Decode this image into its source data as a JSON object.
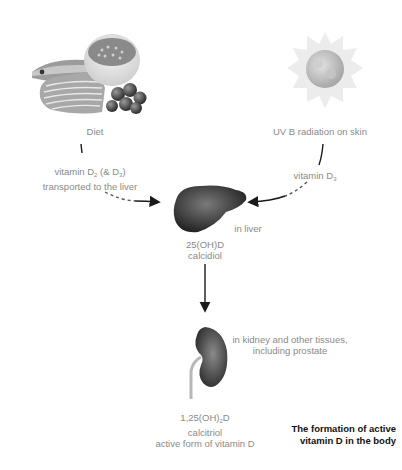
{
  "diagram": {
    "title_line1": "The formation of active",
    "title_line2": "vitamin D in the body",
    "sources": {
      "diet": {
        "label": "Diet",
        "icon": "food-illustration-icon",
        "arrow_label_line1_pre": "vitamin D",
        "arrow_label_line1_sub1": "2",
        "arrow_label_line1_mid": " (& D",
        "arrow_label_line1_sub2": "3",
        "arrow_label_line1_post": ")",
        "arrow_label_line2": "transported to the liver"
      },
      "sun": {
        "label": "UV B radiation on skin",
        "icon": "sun-icon",
        "arrow_label_pre": "vitamin D",
        "arrow_label_sub": "3"
      }
    },
    "liver": {
      "icon": "liver-icon",
      "location_label": "in liver",
      "compound_line1": "25(OH)D",
      "compound_line2": "calcidiol"
    },
    "kidney": {
      "icon": "kidney-icon",
      "location_line1": "in kidney and other tissues,",
      "location_line2": "including prostate",
      "compound_line1_pre": "1,25(OH)",
      "compound_line1_sub": "2",
      "compound_line1_post": "D",
      "compound_line2": "calcitriol",
      "compound_line3": "active form of vitamin D"
    },
    "colors": {
      "label_text": "#8a8a8a",
      "caption_text": "#111111",
      "arrow": "#1a1a1a"
    }
  }
}
